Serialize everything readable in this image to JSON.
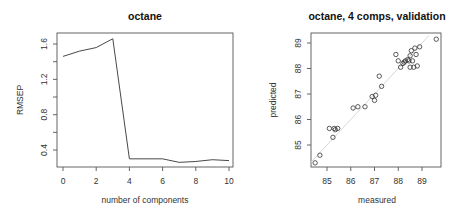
{
  "chart_data": [
    {
      "type": "line",
      "title": "octane",
      "xlabel": "number of components",
      "ylabel": "RMSEP",
      "x": [
        0,
        1,
        2,
        3,
        4,
        5,
        6,
        7,
        8,
        9,
        10
      ],
      "series": [
        {
          "name": "RMSEP",
          "values": [
            1.46,
            1.52,
            1.56,
            1.66,
            0.3,
            0.3,
            0.3,
            0.26,
            0.27,
            0.29,
            0.28
          ]
        }
      ],
      "xticks": [
        "0",
        "2",
        "4",
        "6",
        "8",
        "10"
      ],
      "yticks": [
        "0.4",
        "0.8",
        "1.2",
        "1.6"
      ],
      "xlim": [
        0,
        10
      ],
      "ylim": [
        0.24,
        1.68
      ],
      "grid": false,
      "legend": null
    },
    {
      "type": "scatter",
      "title": "octane, 4 comps, validation",
      "xlabel": "measured",
      "ylabel": "predicted",
      "points": [
        [
          84.5,
          84.3
        ],
        [
          84.7,
          84.6
        ],
        [
          85.1,
          85.65
        ],
        [
          85.3,
          85.65
        ],
        [
          85.35,
          85.6
        ],
        [
          85.45,
          85.65
        ],
        [
          85.25,
          85.3
        ],
        [
          86.1,
          86.45
        ],
        [
          86.3,
          86.5
        ],
        [
          86.6,
          86.5
        ],
        [
          86.9,
          86.9
        ],
        [
          87.05,
          86.95
        ],
        [
          87.0,
          86.75
        ],
        [
          87.2,
          87.7
        ],
        [
          87.3,
          87.3
        ],
        [
          87.9,
          88.55
        ],
        [
          88.0,
          88.3
        ],
        [
          88.1,
          88.05
        ],
        [
          88.2,
          88.2
        ],
        [
          88.25,
          88.25
        ],
        [
          88.3,
          88.3
        ],
        [
          88.4,
          88.35
        ],
        [
          88.45,
          88.3
        ],
        [
          88.5,
          88.5
        ],
        [
          88.55,
          88.7
        ],
        [
          88.6,
          88.3
        ],
        [
          88.65,
          88.05
        ],
        [
          88.7,
          88.8
        ],
        [
          88.75,
          88.55
        ],
        [
          88.8,
          88.1
        ],
        [
          88.9,
          88.85
        ],
        [
          88.5,
          88.05
        ],
        [
          89.6,
          89.15
        ]
      ],
      "reference_line": "y = x",
      "xticks": [
        "85",
        "86",
        "87",
        "88",
        "89"
      ],
      "yticks": [
        "85",
        "86",
        "87",
        "88",
        "89"
      ],
      "xlim": [
        84.3,
        89.8
      ],
      "ylim": [
        84.1,
        89.3
      ],
      "grid": false,
      "legend": null
    }
  ],
  "colors": {
    "line": "#333333",
    "axis": "#555555",
    "reference_line": "#d3d3d3",
    "points": "#333333"
  }
}
